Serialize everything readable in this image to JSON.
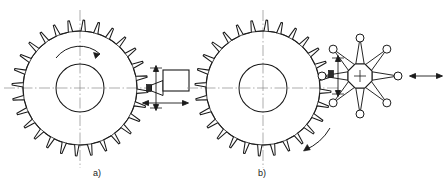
{
  "figure": {
    "background_color": "#ffffff",
    "line_color": "#1a1a1a",
    "centerline_color": "#8a8a8a",
    "width": 445,
    "height": 188
  },
  "panels": [
    {
      "id": "a",
      "label": "a)",
      "label_x": 97,
      "label_y": 176,
      "method": "single-point form tool shaping",
      "gear": {
        "name": "workpiece-gear-a",
        "center_x": 80,
        "center_y": 88,
        "outer_radius": 68,
        "root_radius": 57,
        "tooth_count": 28,
        "bore_radius": 24
      },
      "tool": {
        "name": "form-tool-a",
        "shape": "rectangular body with tapered shank",
        "body_x": 163,
        "body_y": 70,
        "body_width": 26,
        "body_height": 21,
        "tip_x": 149,
        "tip_y": 88
      },
      "arrows": [
        {
          "name": "gear-rotation-arrow-a",
          "type": "curved",
          "direction": "clockwise"
        },
        {
          "name": "tool-vertical-stroke-arrow-a",
          "type": "double-headed",
          "direction": "vertical"
        },
        {
          "name": "tool-horizontal-feed-arrow-a",
          "type": "double-headed",
          "direction": "horizontal"
        }
      ],
      "centerlines": [
        "vertical",
        "horizontal"
      ]
    },
    {
      "id": "b",
      "label": "b)",
      "label_x": 262,
      "label_y": 176,
      "method": "rotary multi-tooth cutter",
      "gear": {
        "name": "workpiece-gear-b",
        "center_x": 263,
        "center_y": 88,
        "outer_radius": 68,
        "root_radius": 57,
        "tooth_count": 28,
        "bore_radius": 24
      },
      "cutter": {
        "name": "rotary-star-cutter-b",
        "center_x": 360,
        "center_y": 76,
        "hub_radius": 13,
        "hub_sides": 8,
        "arm_count": 8,
        "arm_length": 38,
        "tip_circle_radius": 4,
        "center_mark": "cross"
      },
      "arrows": [
        {
          "name": "gear-rotation-arrow-b",
          "type": "straight-curved",
          "direction": "counterclockwise"
        },
        {
          "name": "cutter-vertical-stroke-arrow-b",
          "type": "double-headed",
          "direction": "vertical"
        },
        {
          "name": "cutter-horizontal-feed-arrow-b",
          "type": "double-headed",
          "direction": "horizontal"
        }
      ],
      "centerlines": [
        "vertical",
        "horizontal"
      ]
    }
  ]
}
